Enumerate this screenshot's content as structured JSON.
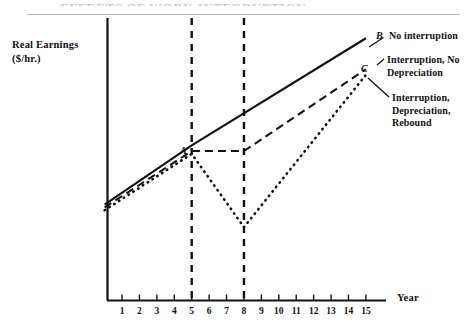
{
  "figure": {
    "title_partial": "EFFECTS OF WORK INTERRUPTION",
    "y_axis_label_line1": "Real Earnings",
    "y_axis_label_line2": "($/hr.)",
    "x_axis_label": "Year",
    "point_a": "A",
    "point_b": "B",
    "point_c": "C",
    "legend_no_interruption": "No interruption",
    "legend_interruption_no_depreciation": "Interruption, No\nDepreciation",
    "legend_interruption_depreciation_rebound": "Interruption,\nDepreciation,\nRebound"
  },
  "chart_data": {
    "type": "line",
    "title": "EFFECTS OF WORK INTERRUPTION",
    "xlabel": "Year",
    "ylabel": "Real Earnings ($/hr.)",
    "xlim": [
      0,
      16
    ],
    "ylim": [
      0,
      10
    ],
    "grid": false,
    "legend_position": "right-inline-annotations",
    "tick_labels": [
      "1",
      "2",
      "3",
      "4",
      "5",
      "6",
      "7",
      "8",
      "9",
      "10",
      "11",
      "12",
      "13",
      "14",
      "15"
    ],
    "x": [
      0,
      1,
      2,
      3,
      4,
      5,
      6,
      7,
      8,
      9,
      10,
      11,
      12,
      13,
      14,
      15
    ],
    "annotations": [
      {
        "label": "A",
        "x": 5,
        "y": 5.5,
        "note": "earnings level at start of work interruption"
      },
      {
        "label": "B",
        "x": 15,
        "y": 9.3,
        "note": "end point of uninterrupted earnings path"
      },
      {
        "label": "C",
        "x": 15,
        "y": 8.2,
        "note": "end point of interrupted paths"
      }
    ],
    "interruption_start_year": 5,
    "interruption_end_year": 8,
    "series": [
      {
        "name": "No interruption",
        "style": "solid",
        "x": [
          0,
          5,
          15
        ],
        "values": [
          3.4,
          5.5,
          9.3
        ]
      },
      {
        "name": "Interruption, No Depreciation",
        "style": "dashed",
        "x": [
          0,
          5,
          8,
          15
        ],
        "values": [
          3.3,
          5.3,
          5.3,
          8.2
        ]
      },
      {
        "name": "Interruption, Depreciation, Rebound",
        "style": "dotted",
        "x": [
          0,
          5,
          8,
          15
        ],
        "values": [
          3.2,
          5.2,
          2.6,
          8.0
        ]
      }
    ],
    "vertical_markers": [
      {
        "x": 5,
        "style": "dashed"
      },
      {
        "x": 8,
        "style": "dashed"
      }
    ]
  }
}
